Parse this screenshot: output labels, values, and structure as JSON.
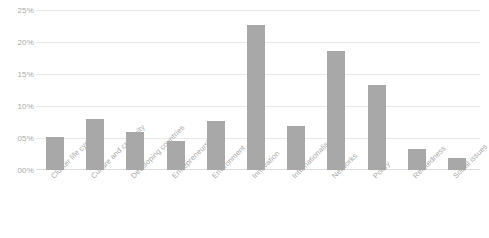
{
  "chart_data": {
    "type": "bar",
    "title": "",
    "xlabel": "",
    "ylabel": "",
    "ylim": [
      0,
      25
    ],
    "grid": true,
    "legend": "none",
    "orientation": "vertical",
    "bar_color": "#a8a8a8",
    "gridline_color": "#e9e9e9",
    "label_color": "#a9a9a9",
    "ytick_labels": [
      "00%",
      "05%",
      "10%",
      "15%",
      "20%",
      "25%"
    ],
    "ytick_values": [
      0,
      5,
      10,
      15,
      20,
      25
    ],
    "categories": [
      "Cluster life cycle",
      "Culture and creativity",
      "Developing countries",
      "Entrepreneurship",
      "Environment",
      "Innovation",
      "Internationalisation",
      "Networks",
      "Policy",
      "Relatedness",
      "Social issues"
    ],
    "values": [
      5.2,
      8.0,
      5.9,
      4.6,
      7.6,
      22.7,
      6.8,
      18.6,
      13.3,
      3.3,
      1.8
    ]
  }
}
